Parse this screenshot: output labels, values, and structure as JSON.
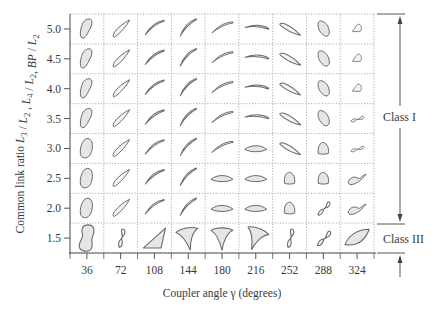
{
  "figure": {
    "y_axis_label": "Common link ratio L3 / L2 , L4 / L2, BP / L2",
    "y_axis_label_parts": [
      {
        "text": "Common link ratio ",
        "italic": false
      },
      {
        "text": "L",
        "italic": true
      },
      {
        "text": "3",
        "sub": true
      },
      {
        "text": " / ",
        "italic": false
      },
      {
        "text": "L",
        "italic": true
      },
      {
        "text": "2",
        "sub": true
      },
      {
        "text": " , ",
        "italic": false
      },
      {
        "text": "L",
        "italic": true
      },
      {
        "text": "4",
        "sub": true
      },
      {
        "text": " / ",
        "italic": false
      },
      {
        "text": "L",
        "italic": true
      },
      {
        "text": "2",
        "sub": true
      },
      {
        "text": ", ",
        "italic": false
      },
      {
        "text": "BP",
        "italic": true
      },
      {
        "text": " / ",
        "italic": false
      },
      {
        "text": "L",
        "italic": true
      },
      {
        "text": "2",
        "sub": true
      }
    ],
    "x_axis_label": "Coupler angle γ (degrees)",
    "y_ticks": [
      "5.0",
      "4.5",
      "4.0",
      "3.5",
      "3.0",
      "2.5",
      "2.0",
      "1.5"
    ],
    "x_ticks": [
      "36",
      "72",
      "108",
      "144",
      "180",
      "216",
      "252",
      "288",
      "324"
    ],
    "classes": [
      {
        "label": "Class I",
        "rows": "5.0–2.0"
      },
      {
        "label": "Class III",
        "rows": "1.5"
      }
    ],
    "colors": {
      "grid": "#9a9a9a",
      "axis": "#555555",
      "curve_stroke": "#6a6a6a",
      "curve_fill": "#e6e6e6",
      "text": "#3a3a3a"
    }
  },
  "chart_data": {
    "type": "table",
    "xlabel": "Coupler angle γ (degrees)",
    "ylabel": "Common link ratio L3/L2, L4/L2, BP/L2",
    "columns": [
      36,
      72,
      108,
      144,
      180,
      216,
      252,
      288,
      324
    ],
    "rows": [
      5.0,
      4.5,
      4.0,
      3.5,
      3.0,
      2.5,
      2.0,
      1.5
    ],
    "class_regions": [
      {
        "label": "Class I",
        "from": 2.0,
        "to": 5.0
      },
      {
        "label": "Class III",
        "from": 1.5,
        "to": 1.5
      }
    ],
    "cells": [
      [
        "bean",
        "crescent",
        "arc",
        "arc",
        "arc",
        "arc",
        "crescent",
        "ellipse",
        "teardrop"
      ],
      [
        "bean",
        "crescent",
        "arc",
        "arc",
        "arc",
        "arc",
        "crescent",
        "ellipse",
        "teardrop"
      ],
      [
        "bean",
        "crescent",
        "arc",
        "arc",
        "arc",
        "arc",
        "crescent",
        "ellipse",
        "teardrop"
      ],
      [
        "bean",
        "crescent",
        "arc",
        "arc",
        "arc",
        "arc",
        "crescent",
        "ellipse",
        "figure8"
      ],
      [
        "oval",
        "crescent",
        "arc",
        "arc",
        "arc",
        "lens",
        "crescent",
        "dome",
        "figure8"
      ],
      [
        "oval",
        "crescent",
        "arc",
        "arc",
        "lens",
        "lens",
        "dome",
        "dome",
        "loop"
      ],
      [
        "oval",
        "crescent",
        "arc",
        "arc",
        "lens",
        "lens",
        "dome",
        "figure8",
        "loop"
      ],
      [
        "peanut",
        "figure8",
        "triangle",
        "fan",
        "fan",
        "fan",
        "figure8",
        "figure8",
        "leaf"
      ]
    ]
  }
}
